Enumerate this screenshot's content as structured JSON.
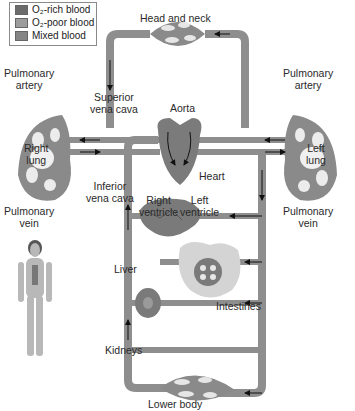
{
  "legend": {
    "items": [
      {
        "label": "O₂-rich blood",
        "color": "#6b6b6b"
      },
      {
        "label": "O₂-poor blood",
        "color": "#9c9c9c"
      },
      {
        "label": "Mixed blood",
        "color": "#858585"
      }
    ]
  },
  "labels": {
    "head_neck": "Head and neck",
    "pulm_artery_left": "Pulmonary\nartery",
    "pulm_artery_right": "Pulmonary\nartery",
    "superior_vena_cava": "Superior\nvena cava",
    "aorta": "Aorta",
    "right_lung": "Right\nlung",
    "left_lung": "Left\nlung",
    "heart": "Heart",
    "inferior_vena_cava": "Inferior\nvena cava",
    "right_ventricle": "Right\nventricle",
    "left_ventricle": "Left\nventricle",
    "pulm_vein_left": "Pulmonary\nvein",
    "pulm_vein_right": "Pulmonary\nvein",
    "liver": "Liver",
    "intestines": "Intestines",
    "kidneys": "Kidneys",
    "lower_body": "Lower body"
  },
  "colors": {
    "vessel": "#8f8f8f",
    "vessel_dark": "#6e6e6e",
    "organ_fill": "#7a7a7a",
    "organ_light": "#d8d8d8",
    "arrow": "#111111"
  }
}
